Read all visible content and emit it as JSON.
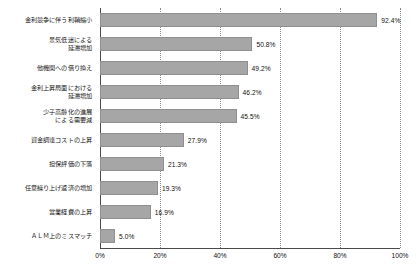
{
  "chart_data": {
    "type": "bar",
    "orientation": "horizontal",
    "title": "",
    "subtitle": "",
    "xlabel": "",
    "ylabel": "",
    "xlim": [
      0,
      100
    ],
    "xticks": [
      "0%",
      "20%",
      "40%",
      "60%",
      "80%",
      "100%"
    ],
    "xtick_values": [
      0,
      20,
      40,
      60,
      80,
      100
    ],
    "grid": "vertical-dotted",
    "legend": "none",
    "bar_color": "#a6a6a6",
    "bar_border_color": "#8f8f8f",
    "axis_color": "#4a4a4a",
    "gridline_color": "#8a8a8a",
    "text_color": "#111111",
    "categories": [
      "金利競争に伴う利鞘縮小",
      "景気低迷による\n延滞増加",
      "他機関への借り換え",
      "金利上昇局面における\n延滞増加",
      "少子高齢化の進展\nによる需要減",
      "資金調達コストの上昇",
      "担保評価の下落",
      "任意繰り上げ返済の増加",
      "営業経費の上昇",
      "ＡＬＭ上のミスマッチ"
    ],
    "values": [
      92.4,
      50.8,
      49.2,
      46.2,
      45.5,
      27.9,
      21.3,
      19.3,
      16.9,
      5.0
    ],
    "value_labels": [
      "92.4%",
      "50.8%",
      "49.2%",
      "46.2%",
      "45.5%",
      "27.9%",
      "21.3%",
      "19.3%",
      "16.9%",
      "5.0%"
    ]
  }
}
